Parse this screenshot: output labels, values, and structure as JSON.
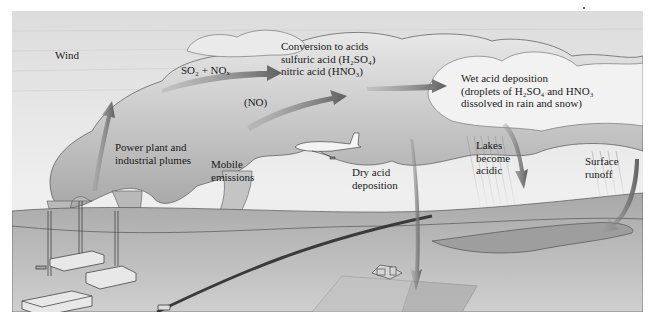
{
  "figure": {
    "colors": {
      "sky": "#e4e4e4",
      "cloud": "#d2d2d2",
      "cloud_dark": "#a9a9a9",
      "ground": "#b8b8b8",
      "arrow": "#6b6b6b",
      "text": "#1a1a1a"
    }
  },
  "labels": {
    "wind": "Wind",
    "so2_nox": {
      "text": "SO₂ + NOₓ"
    },
    "conversion": {
      "line1": "Conversion to acids",
      "line2": "sulfuric acid (H₂SO₄)",
      "line3": "nitric acid (HNO₃)"
    },
    "no": "(NO)",
    "wet_deposition": {
      "line1": "Wet acid deposition",
      "line2": "(droplets of H₂SO₄ and HNO₃",
      "line3": "dissolved in rain and snow)"
    },
    "power_plant": {
      "line1": "Power plant and",
      "line2": "industrial plumes"
    },
    "mobile": {
      "line1": "Mobile",
      "line2": "emissions"
    },
    "dry_deposition": {
      "line1": "Dry acid",
      "line2": "deposition"
    },
    "lakes": {
      "line1": "Lakes",
      "line2": "become",
      "line3": "acidic"
    },
    "runoff": {
      "line1": "Surface",
      "line2": "runoff"
    }
  },
  "icons": {
    "factory": "factory-icon",
    "airplane": "airplane-icon",
    "car": "car-icon",
    "farmhouse": "farmhouse-icon",
    "arrow": "arrow-icon",
    "rain": "rain-icon"
  }
}
